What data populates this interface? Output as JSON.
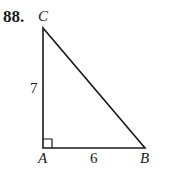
{
  "problem": {
    "number": "88.",
    "figure": {
      "type": "right-triangle",
      "vertices": {
        "A": "A",
        "B": "B",
        "C": "C"
      },
      "right_angle_at": "A",
      "sides": {
        "AC": "7",
        "AB": "6"
      }
    }
  }
}
